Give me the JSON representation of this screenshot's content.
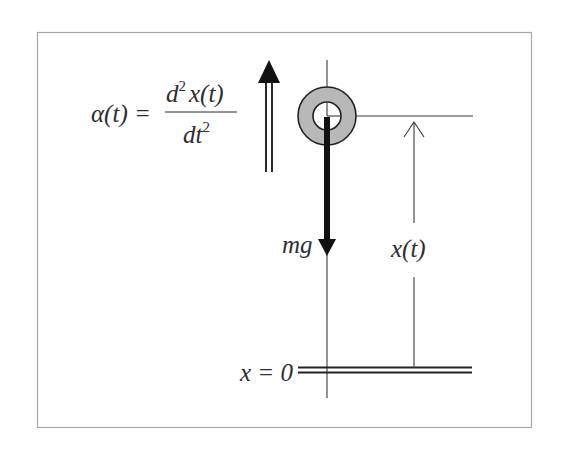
{
  "diagram": {
    "type": "free-body diagram (falling mass)",
    "frame": {
      "border_color": "#a8a8a8",
      "background": "#ffffff"
    },
    "colors": {
      "ink": "#2e2e2e",
      "line": "#3a3a3a",
      "ring_fill": "#b8b8b8",
      "arrow_fill": "#111111"
    },
    "labels": {
      "acceleration": {
        "lhs": "α(t) =",
        "numerator_d": "d",
        "numerator_exp": "2",
        "numerator_rest": "x(t)",
        "denominator_base": "dt",
        "denominator_exp": "2"
      },
      "force": "mg",
      "position": "x(t)",
      "ground": "x = 0"
    },
    "elements": [
      {
        "name": "mass",
        "shape": "ring",
        "description": "grey ring representing the mass"
      },
      {
        "name": "acceleration-arrow",
        "shape": "double-shaft arrow",
        "direction": "up"
      },
      {
        "name": "gravity-arrow",
        "shape": "thick arrow",
        "direction": "down",
        "label": "mg"
      },
      {
        "name": "position-dimension",
        "shape": "open arrow",
        "direction": "up",
        "label": "x(t)"
      },
      {
        "name": "ground-line",
        "shape": "double line",
        "label": "x = 0"
      },
      {
        "name": "vertical-axis",
        "shape": "line"
      },
      {
        "name": "height-reference-line",
        "shape": "line"
      }
    ]
  }
}
